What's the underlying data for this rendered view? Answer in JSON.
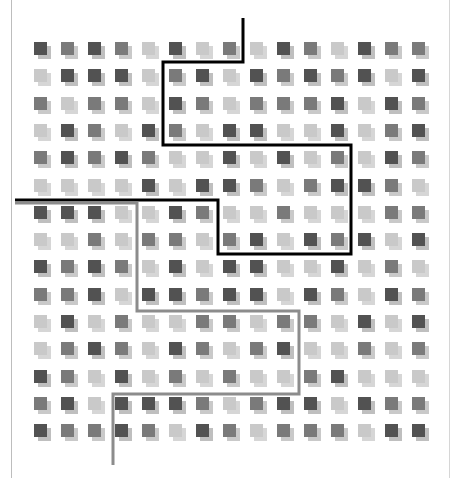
{
  "diagram": {
    "grid": {
      "rows": 15,
      "cols": 15,
      "origin_x": 34,
      "origin_y": 42,
      "pitch_x": 27,
      "pitch_y": 27.3,
      "cell_size": 13,
      "shadow_offset": 4,
      "shade_legend": {
        "D": "dark",
        "M": "medium",
        "L": "light"
      },
      "cells": [
        "DMDMLDLMLDMLDMM",
        "LDDDLMDLDMDMDLD",
        "MLMMLDMLMMMDLDM",
        "LDMLDMLDDLLDLMD",
        "MDMDMLLDLDLMLDM",
        "LLLLDLDDMLMDDML",
        "DDDLLDMLLMLLLMM",
        "LLMLMMLMDLDMDLD",
        "DMDMLDLDDLLDLML",
        "MMDLDDMDDLDMLDM",
        "LDLMLLMMLMMLDLD",
        "LMDMLDMLMDLLMLM",
        "DMLDLMLMLLMDLLL",
        "MDLDDDMLMDDLDMM",
        "DMMDMLDMLMMMLDD"
      ]
    },
    "colors": {
      "dark": "#525252",
      "medium": "#7a7a7a",
      "light": "#c9c9c9",
      "dark_shadow": "#8a8a8a",
      "medium_shadow": "#9c9c9c",
      "light_shadow": "#b4b4b4",
      "black_path": "#000000",
      "gray_path": "#8c8c8c",
      "frame": "#bdbdbd"
    },
    "paths": [
      {
        "name": "black-partition-path",
        "color": "#000000",
        "width": 3,
        "points": [
          [
            243,
            18
          ],
          [
            243,
            62
          ],
          [
            163,
            62
          ],
          [
            163,
            145
          ],
          [
            351,
            145
          ],
          [
            351,
            254
          ],
          [
            218,
            254
          ],
          [
            218,
            200
          ],
          [
            15,
            200
          ]
        ]
      },
      {
        "name": "gray-partition-path",
        "color": "#8c8c8c",
        "width": 3,
        "points": [
          [
            15,
            203
          ],
          [
            137,
            203
          ],
          [
            137,
            311
          ],
          [
            299,
            311
          ],
          [
            299,
            394
          ],
          [
            113,
            394
          ],
          [
            113,
            465
          ]
        ]
      }
    ]
  }
}
